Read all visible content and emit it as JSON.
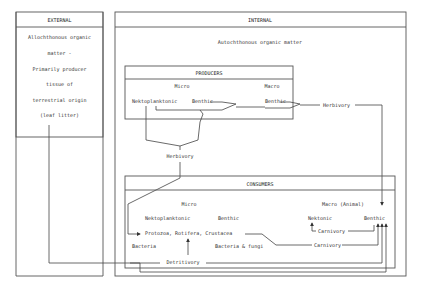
{
  "external": {
    "header": "EXTERNAL",
    "lines": [
      "Allochthonous organic",
      "matter -",
      "Primarily producer",
      "tissue of",
      "terrestrial origin",
      "(leaf litter)"
    ]
  },
  "internal": {
    "header": "INTERNAL",
    "subtitle": "Autochthonous organic matter",
    "producers": {
      "header": "PRODUCERS",
      "micro_label": "Micro",
      "macro_label": "Macro",
      "micro_nektoplanktonic": "Nektoplanktonic",
      "micro_benthic": "Benthic",
      "macro_benthic": "Benthic"
    },
    "herbivory_right": "Herbivory",
    "herbivory_mid": "Herbivory",
    "consumers": {
      "header": "CONSUMERS",
      "micro_label": "Micro",
      "macro_label": "Macro (Animal)",
      "micro_nektoplanktonic": "Nektoplanktonic",
      "micro_benthic": "Benthic",
      "protozoa": "Protozoa, Rotifera, Crustacea",
      "bacteria": "Bacteria",
      "bacteria_fungi": "Bacteria & fungi",
      "macro_nektonic": "Nektonic",
      "macro_benthic": "Benthic",
      "carnivory_upper": "Carnivory",
      "carnivory_lower": "Carnivory"
    },
    "detritivory": "Detritivory"
  }
}
